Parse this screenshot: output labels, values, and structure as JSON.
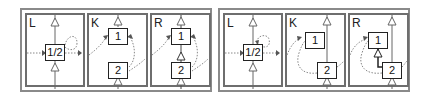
{
  "diagram": {
    "rules": [
      {
        "id": "rule-left",
        "panels": [
          {
            "label": "L",
            "nodes": [
              {
                "text": "1/2"
              }
            ]
          },
          {
            "label": "K",
            "nodes": [
              {
                "text": "1"
              },
              {
                "text": "2"
              }
            ]
          },
          {
            "label": "R",
            "nodes": [
              {
                "text": "1"
              },
              {
                "text": "2"
              }
            ]
          }
        ]
      },
      {
        "id": "rule-right",
        "panels": [
          {
            "label": "L",
            "nodes": [
              {
                "text": "1/2"
              }
            ]
          },
          {
            "label": "K",
            "nodes": [
              {
                "text": "1"
              },
              {
                "text": "2"
              }
            ]
          },
          {
            "label": "R",
            "nodes": [
              {
                "text": "1"
              },
              {
                "text": "2"
              }
            ]
          }
        ]
      }
    ],
    "colors": {
      "border": "#6e6e6e",
      "node_border": "#222222",
      "edge": "#666666",
      "dotted": "#8a8a8a"
    }
  }
}
